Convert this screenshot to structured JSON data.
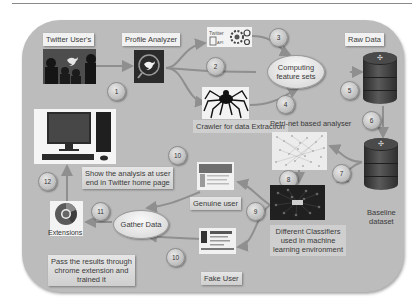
{
  "diagram": {
    "nodes": {
      "twitter_users": {
        "label": "Twitter User's",
        "icon": "twitter-bird-icon"
      },
      "profile_analyzer": {
        "label": "Profile Analyzer",
        "icon": "twitter-search-icon"
      },
      "twitter_api": {
        "label": "Twitter API",
        "icon": "gear-cluster-icon"
      },
      "computing": {
        "label_line1": "Computing",
        "label_line2": "feature sets"
      },
      "crawler": {
        "label": "Crawler for data Extraction",
        "icon": "spider-icon"
      },
      "petri_net": {
        "label": "Petri-net based analyser"
      },
      "raw_data": {
        "label": "Raw Data",
        "icon": "database-icon"
      },
      "baseline": {
        "label_line1": "Baseline",
        "label_line2": "dataset",
        "icon": "database-icon"
      },
      "classifiers": {
        "line1": "Different Classifiers",
        "line2": "used in machine",
        "line3": "learning environment"
      },
      "genuine_user": {
        "label": "Genuine user"
      },
      "fake_user": {
        "label": "Fake User"
      },
      "gather_data": {
        "label": "Gather Data"
      },
      "extensions": {
        "label": "Extensions",
        "icon": "chrome-icon"
      },
      "show_analysis": {
        "line1": "Show the analysis at user",
        "line2": "end in Twitter home page"
      },
      "pass_results": {
        "line1": "Pass the results through",
        "line2": "chrome extension and",
        "line3": "trained it"
      },
      "computer": {
        "icon": "desktop-computer-icon"
      }
    },
    "steps": [
      "1",
      "2",
      "3",
      "4",
      "5",
      "6",
      "7",
      "8",
      "9",
      "10",
      "11",
      "10",
      "12"
    ],
    "colors": {
      "panel": "#bcbcbc",
      "label_bg": "#f1f1f1",
      "arrow": "#8f8f8f",
      "text": "#3a3a3a"
    }
  }
}
